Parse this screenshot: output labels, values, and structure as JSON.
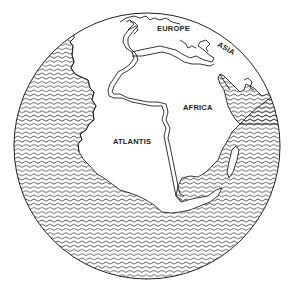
{
  "map": {
    "title": "Hypothetical globe showing Atlantis between the Americas and Africa",
    "style": "line-drawing",
    "colors": {
      "ink": "#222222",
      "land": "#ffffff",
      "ocean_pattern": "#333333",
      "background": "#ffffff"
    },
    "globe": {
      "cx": 147,
      "cy": 146,
      "r": 133
    },
    "labels": [
      {
        "id": "europe",
        "text": "EUROPE",
        "x": 157,
        "y": 31,
        "rotate": 0
      },
      {
        "id": "asia",
        "text": "ASIA",
        "x": 217,
        "y": 46,
        "rotate": 30
      },
      {
        "id": "africa",
        "text": "AFRICA",
        "x": 183,
        "y": 110,
        "rotate": 0
      },
      {
        "id": "atlantis",
        "text": "ATLANTIS",
        "x": 113,
        "y": 144,
        "rotate": 0
      }
    ]
  }
}
